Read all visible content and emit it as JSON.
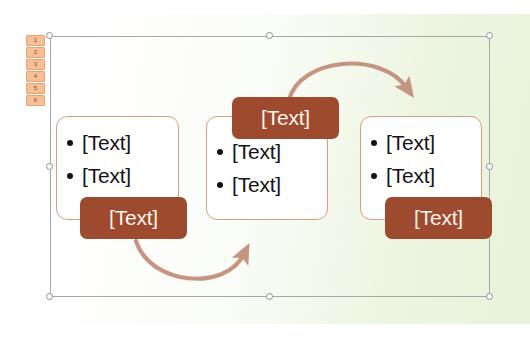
{
  "app": {
    "type": "slide-editor-canvas",
    "selected_object": "smartart-diagram"
  },
  "colors": {
    "label_fill": "#9d4a2f",
    "label_text": "#fdf4ee",
    "outline_border": "#dd9b7f",
    "arrow": "#c69581",
    "tab_fill": "#f7bf95",
    "tab_border": "#e8a372",
    "tab_text": "#8a4a22",
    "selection_border": "#a7a7a7",
    "handle_fill": "#ffffff",
    "background_tint": "#e9f3db",
    "bullet_text": "#141414"
  },
  "tab_strip": {
    "name": "slide-thumbnail-numbers",
    "items": [
      "1",
      "2",
      "3",
      "4",
      "5",
      "6"
    ]
  },
  "diagram": {
    "type": "continuous-cycle-smartart",
    "groups": [
      {
        "id": "left",
        "label": "[Text]",
        "label_position": "bottom",
        "bullets": [
          "[Text]",
          "[Text]"
        ]
      },
      {
        "id": "middle",
        "label": "[Text]",
        "label_position": "top",
        "bullets": [
          "[Text]",
          "[Text]"
        ]
      },
      {
        "id": "right",
        "label": "[Text]",
        "label_position": "bottom",
        "bullets": [
          "[Text]",
          "[Text]"
        ]
      }
    ],
    "arrows": [
      {
        "id": "top-arrow",
        "from": "middle",
        "to": "right",
        "direction": "clockwise-over-top"
      },
      {
        "id": "bottom-arrow",
        "from": "left",
        "to": "middle",
        "direction": "clockwise-under-bottom"
      }
    ]
  },
  "selection": {
    "name": "selection-frame",
    "handles": [
      "top-left",
      "top-center",
      "top-right",
      "middle-left",
      "middle-right",
      "bottom-left",
      "bottom-center",
      "bottom-right"
    ]
  }
}
